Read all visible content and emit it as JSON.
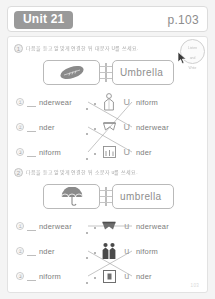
{
  "header": {
    "unit_label": "Unit 21",
    "page_label": "p.103"
  },
  "sticker": {
    "line1": "Listen",
    "line2": "and",
    "line3": "Write"
  },
  "sections": [
    {
      "number": "1",
      "instruction": "다음을 듣고 알맞게 연결한 뒤 대문자 U를 쓰세요.",
      "example": {
        "image_icon": "rugby-ball-icon",
        "word": "Umbrella"
      },
      "letter": "U",
      "left_items": [
        {
          "number": "①",
          "fragment": "nderwear"
        },
        {
          "number": "②",
          "fragment": "nder"
        },
        {
          "number": "③",
          "fragment": "niform"
        }
      ],
      "right_items": [
        {
          "image_icon": "person-uniform-icon",
          "letter": "U",
          "fragment": "niform"
        },
        {
          "image_icon": "underwear-icon",
          "letter": "U",
          "fragment": "nderwear"
        },
        {
          "image_icon": "under-table-icon",
          "letter": "U",
          "fragment": "nder"
        }
      ],
      "connections": [
        {
          "from": 0,
          "to": 1
        },
        {
          "from": 1,
          "to": 2
        },
        {
          "from": 2,
          "to": 0
        }
      ]
    },
    {
      "number": "2",
      "instruction": "다음을 듣고 알맞게 연결한 뒤 소문자 u를 쓰세요.",
      "example": {
        "image_icon": "umbrella-icon",
        "word": "umbrella"
      },
      "letter": "u",
      "left_items": [
        {
          "number": "①",
          "fragment": "nderwear"
        },
        {
          "number": "②",
          "fragment": "nder"
        },
        {
          "number": "③",
          "fragment": "niform"
        }
      ],
      "right_items": [
        {
          "image_icon": "underwear-icon",
          "letter": "u",
          "fragment": "nderwear"
        },
        {
          "image_icon": "two-people-uniform-icon",
          "letter": "u",
          "fragment": "niform"
        },
        {
          "image_icon": "under-box-icon",
          "letter": "u",
          "fragment": "nder"
        }
      ],
      "connections": [
        {
          "from": 0,
          "to": 0
        },
        {
          "from": 1,
          "to": 2
        },
        {
          "from": 2,
          "to": 1
        }
      ]
    }
  ],
  "footer": {
    "page_number": "103"
  }
}
